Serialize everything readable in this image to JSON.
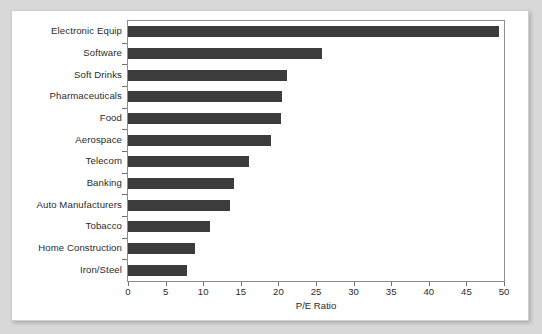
{
  "chart_data": {
    "type": "bar",
    "orientation": "horizontal",
    "title": "",
    "xlabel": "P/E Ratio",
    "ylabel": "",
    "xlim": [
      0,
      50
    ],
    "xticks": [
      0,
      5,
      10,
      15,
      20,
      25,
      30,
      35,
      40,
      45,
      50
    ],
    "grid": false,
    "legend": null,
    "bar_color": "#3c3c3c",
    "categories": [
      "Electronic Equip",
      "Software",
      "Soft Drinks",
      "Pharmaceuticals",
      "Food",
      "Aerospace",
      "Telecom",
      "Banking",
      "Auto Manufacturers",
      "Tobacco",
      "Home Construction",
      "Iron/Steel"
    ],
    "values": [
      49.3,
      25.8,
      21.1,
      20.5,
      20.3,
      19.0,
      16.1,
      14.1,
      13.6,
      10.9,
      8.9,
      7.8
    ]
  }
}
